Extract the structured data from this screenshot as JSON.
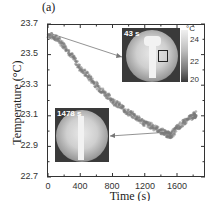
{
  "panel_label": "(a)",
  "chart_data": {
    "type": "scatter",
    "title": "",
    "xlabel": "Time (s)",
    "ylabel": "Temperature (°C)",
    "xlim": [
      0,
      1960
    ],
    "ylim": [
      22.7,
      23.7
    ],
    "xticks": [
      0,
      400,
      800,
      1200,
      1600
    ],
    "yticks": [
      22.7,
      22.9,
      23.1,
      23.3,
      23.5,
      23.7
    ],
    "grid": false,
    "legend": null,
    "series": [
      {
        "name": "Temperature",
        "color": "#7a7a7a",
        "x": [
          0,
          100,
          200,
          300,
          400,
          500,
          600,
          700,
          800,
          900,
          1000,
          1100,
          1200,
          1300,
          1400,
          1478,
          1525,
          1600,
          1700,
          1800,
          1840
        ],
        "y": [
          23.63,
          23.61,
          23.56,
          23.49,
          23.41,
          23.36,
          23.3,
          23.25,
          23.2,
          23.16,
          23.12,
          23.09,
          23.05,
          23.03,
          23.0,
          22.98,
          22.97,
          23.02,
          23.06,
          23.1,
          23.11
        ]
      }
    ],
    "annotations": [
      {
        "type": "inset-thermal-image",
        "label": "43 s",
        "points_to_x": 43,
        "points_to_y": 23.62
      },
      {
        "type": "inset-thermal-image",
        "label": "1478 s",
        "points_to_x": 1478,
        "points_to_y": 22.98
      }
    ],
    "colorbar": {
      "unit": "°C",
      "ticks": [
        24,
        22,
        20
      ]
    }
  },
  "axis": {
    "ytick_labels": [
      "23.7",
      "23.5",
      "23.3",
      "23.1",
      "22.9",
      "22.7"
    ],
    "xtick_labels": [
      "0",
      "400",
      "800",
      "1200",
      "1600"
    ],
    "xlabel": "Time (s)",
    "ylabel": "Temperature (°C)"
  },
  "insets": {
    "top": {
      "time_label": "43 s"
    },
    "bottom": {
      "time_label": "1478 s"
    }
  },
  "colorbar": {
    "unit": "°C",
    "labels": [
      "24",
      "22",
      "20"
    ]
  }
}
